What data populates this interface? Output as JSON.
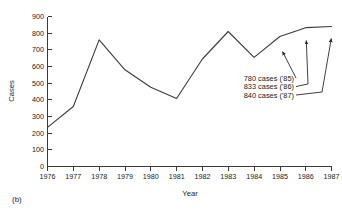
{
  "figure": {
    "panel_label": "(b)"
  },
  "chart_data": {
    "type": "line",
    "title": "",
    "xlabel": "Year",
    "ylabel": "Cases",
    "grid": false,
    "legend": "none",
    "x": [
      1976,
      1977,
      1978,
      1979,
      1980,
      1981,
      1982,
      1983,
      1984,
      1985,
      1986,
      1987
    ],
    "categories": [
      "1976",
      "1977",
      "1978",
      "1979",
      "1980",
      "1981",
      "1982",
      "1983",
      "1984",
      "1985",
      "1986",
      "1987"
    ],
    "values": [
      235,
      360,
      760,
      580,
      475,
      408,
      645,
      810,
      655,
      780,
      833,
      840
    ],
    "xlim": [
      1976,
      1987
    ],
    "ylim": [
      0,
      900
    ],
    "ytick_values": [
      0,
      100,
      200,
      300,
      400,
      500,
      600,
      700,
      800,
      900
    ],
    "yticks": [
      "0",
      "100",
      "200",
      "300",
      "400",
      "500",
      "600",
      "700",
      "800",
      "900"
    ],
    "annotations": [
      {
        "text": "780 cases ('85)",
        "target_x": 1985,
        "target_y": 780
      },
      {
        "text": "833 cases ('86)",
        "target_x": 1986,
        "target_y": 833
      },
      {
        "text": "840 cases ('87)",
        "target_x": 1987,
        "target_y": 840
      }
    ]
  }
}
